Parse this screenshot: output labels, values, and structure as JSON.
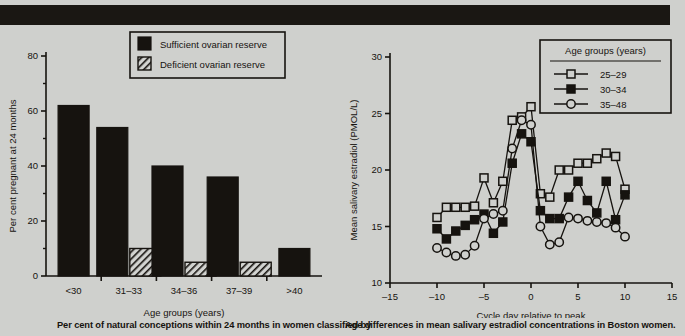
{
  "page": {
    "background_color": "#cfd0cd",
    "banner_color": "#1a1713",
    "ink_color": "#16130f"
  },
  "left_figure": {
    "caption": "Per cent of natural conceptions within 24 months in women classified by",
    "legend": {
      "items": [
        {
          "label": "Sufficient ovarian reserve",
          "swatch": "solid-black-square"
        },
        {
          "label": "Deficient ovarian reserve",
          "swatch": "hatched-square"
        }
      ]
    },
    "chart_data": {
      "type": "bar",
      "title": "",
      "xlabel": "Age groups (years)",
      "ylabel": "Per cent pregnant at 24 months",
      "categories": [
        "<30",
        "31–33",
        "34–36",
        "37–39",
        ">40"
      ],
      "series": [
        {
          "name": "Sufficient ovarian reserve",
          "values": [
            62,
            54,
            40,
            36,
            10
          ]
        },
        {
          "name": "Deficient ovarian reserve",
          "values": [
            null,
            10,
            5,
            5,
            null
          ]
        }
      ],
      "ylim": [
        0,
        80
      ],
      "yticks": [
        0,
        20,
        40,
        60,
        80
      ],
      "ytick_labels": [
        "0",
        "20",
        "40",
        "60",
        "80"
      ],
      "grid": false,
      "legend_position": "top-center"
    }
  },
  "right_figure": {
    "caption": "Age differences in mean salivary estradiol concentrations in Boston women.",
    "legend": {
      "title": "Age groups (years)",
      "items": [
        {
          "label": "25–29",
          "marker": "open-square"
        },
        {
          "label": "30–34",
          "marker": "filled-square"
        },
        {
          "label": "35–48",
          "marker": "open-circle"
        }
      ]
    },
    "chart_data": {
      "type": "line",
      "title": "",
      "xlabel": "Cycle day relative to peak",
      "ylabel": "Mean salivary estradiol (PMOL/L)",
      "x": [
        -10,
        -9,
        -8,
        -7,
        -6,
        -5,
        -4,
        -3,
        -2,
        -1,
        0,
        1,
        2,
        3,
        4,
        5,
        6,
        7,
        8,
        9,
        10
      ],
      "series": [
        {
          "name": "25–29",
          "marker": "open-square",
          "values": [
            15.8,
            16.7,
            16.7,
            16.7,
            16.8,
            19.3,
            17.1,
            19.0,
            24.4,
            24.7,
            25.6,
            17.9,
            17.6,
            20.0,
            20.0,
            20.6,
            20.6,
            21.0,
            21.5,
            21.2,
            18.3
          ]
        },
        {
          "name": "30–34",
          "marker": "filled-square",
          "values": [
            14.8,
            13.9,
            14.6,
            15.1,
            15.6,
            16.1,
            14.4,
            15.4,
            20.6,
            23.2,
            22.5,
            16.4,
            15.7,
            15.7,
            17.6,
            19.0,
            17.3,
            16.2,
            19.0,
            15.6,
            17.8
          ]
        },
        {
          "name": "35–48",
          "marker": "open-circle",
          "values": [
            13.1,
            12.7,
            12.4,
            12.5,
            13.3,
            15.7,
            16.1,
            16.4,
            21.9,
            24.4,
            24.0,
            15.0,
            13.4,
            13.6,
            15.8,
            15.7,
            15.5,
            15.4,
            15.3,
            14.9,
            14.1
          ]
        }
      ],
      "xlim": [
        -15,
        15
      ],
      "xticks": [
        -15,
        -10,
        -5,
        0,
        5,
        10,
        15
      ],
      "xtick_labels": [
        "–15",
        "–10",
        "–5",
        "0",
        "5",
        "10",
        "15"
      ],
      "ylim": [
        10,
        30
      ],
      "yticks": [
        10,
        15,
        20,
        25,
        30
      ],
      "ytick_labels": [
        "10",
        "15",
        "20",
        "25",
        "30"
      ],
      "grid": false,
      "legend_position": "top-right"
    }
  }
}
